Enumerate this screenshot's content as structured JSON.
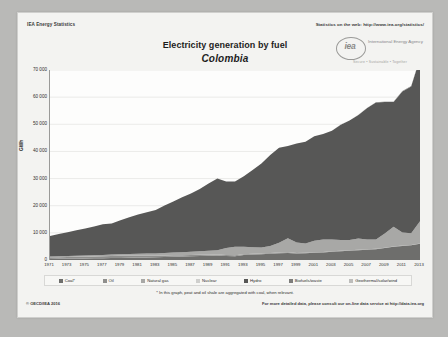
{
  "header": {
    "left": "IEA Energy Statistics",
    "right": "Statistics on the web: http://www.iea.org/statistics/"
  },
  "logo": {
    "word": "iea",
    "name": "International Energy Agency",
    "tagline": "Secure • Sustainable • Together"
  },
  "title": "Electricity generation by fuel",
  "subtitle": "Colombia",
  "footnote": "* In this graph, peat and oil shale are aggregated with coal, when relevant.",
  "copyright": "© OECD/IEA 2016",
  "more_info": "For more detailed data, please consult our on-line data service at http://data.iea.org",
  "colors": {
    "coal": "#6e6e6c",
    "oil": "#8f8f8d",
    "natural_gas": "#a8a8a6",
    "nuclear": "#cfcfcd",
    "hydro": "#575756",
    "biofuels_waste": "#7d7d7b",
    "geothermal_solar_wind": "#bdbdbb",
    "plot_background": "#fdfdfc",
    "axis": "#9a9a98",
    "gridline": "#e2e2e0",
    "paper": "#f3f3f1"
  },
  "chart_data": {
    "type": "area",
    "title": "Electricity generation by fuel",
    "subtitle": "Colombia",
    "xlabel": "",
    "ylabel": "GWh",
    "ylim": [
      0,
      70000
    ],
    "yticks": [
      0,
      10000,
      20000,
      30000,
      40000,
      50000,
      60000,
      70000
    ],
    "ytick_labels": [
      "0",
      "10 000",
      "20 000",
      "30 000",
      "40 000",
      "50 000",
      "60 000",
      "70 000"
    ],
    "grid": true,
    "stacked": true,
    "legend_position": "bottom",
    "xlim": [
      1971,
      2013
    ],
    "xtick_labels": [
      "1971",
      "1973",
      "1975",
      "1977",
      "1979",
      "1981",
      "1983",
      "1985",
      "1987",
      "1989",
      "1991",
      "1993",
      "1995",
      "1997",
      "1999",
      "2001",
      "2003",
      "2005",
      "2007",
      "2009",
      "2011",
      "2013"
    ],
    "x": [
      1971,
      1972,
      1973,
      1974,
      1975,
      1976,
      1977,
      1978,
      1979,
      1980,
      1981,
      1982,
      1983,
      1984,
      1985,
      1986,
      1987,
      1988,
      1989,
      1990,
      1991,
      1992,
      1993,
      1994,
      1995,
      1996,
      1997,
      1998,
      1999,
      2000,
      2001,
      2002,
      2003,
      2004,
      2005,
      2006,
      2007,
      2008,
      2009,
      2010,
      2011,
      2012,
      2013
    ],
    "series": [
      {
        "name": "Coal*",
        "color": "#6e6e6c",
        "values": [
          400,
          430,
          460,
          500,
          540,
          600,
          650,
          700,
          760,
          820,
          880,
          940,
          1000,
          1100,
          1200,
          1300,
          1400,
          1500,
          1600,
          1700,
          1500,
          1400,
          1800,
          2000,
          2100,
          2300,
          2500,
          2600,
          2400,
          2500,
          2700,
          2800,
          3000,
          3200,
          3400,
          3600,
          3800,
          4000,
          4400,
          4900,
          5200,
          5400,
          6000
        ]
      },
      {
        "name": "Oil",
        "color": "#8f8f8d",
        "values": [
          600,
          620,
          640,
          660,
          680,
          700,
          720,
          740,
          760,
          780,
          700,
          650,
          600,
          560,
          520,
          480,
          440,
          400,
          380,
          360,
          340,
          320,
          300,
          280,
          260,
          250,
          240,
          230,
          220,
          210,
          200,
          190,
          180,
          170,
          160,
          150,
          140,
          130,
          120,
          110,
          100,
          95,
          90
        ]
      },
      {
        "name": "Natural gas",
        "color": "#a8a8a6",
        "values": [
          300,
          320,
          350,
          380,
          420,
          460,
          500,
          550,
          600,
          650,
          700,
          760,
          820,
          900,
          1000,
          1100,
          1200,
          1300,
          1400,
          1500,
          2600,
          3200,
          2800,
          2400,
          2200,
          2600,
          3600,
          5200,
          3800,
          3400,
          4200,
          4600,
          4400,
          4000,
          3800,
          4200,
          3600,
          3400,
          5200,
          7200,
          4800,
          4400,
          8200
        ]
      },
      {
        "name": "Nuclear",
        "color": "#cfcfcd",
        "values": [
          0,
          0,
          0,
          0,
          0,
          0,
          0,
          0,
          0,
          0,
          0,
          0,
          0,
          0,
          0,
          0,
          0,
          0,
          0,
          0,
          0,
          0,
          0,
          0,
          0,
          0,
          0,
          0,
          0,
          0,
          0,
          0,
          0,
          0,
          0,
          0,
          0,
          0,
          0,
          0,
          0,
          0,
          0
        ]
      },
      {
        "name": "Hydro",
        "color": "#575756",
        "values": [
          7500,
          8200,
          8800,
          9400,
          10000,
          10600,
          11300,
          11500,
          12500,
          13500,
          14500,
          15200,
          16000,
          17500,
          18800,
          20200,
          21500,
          23000,
          24800,
          26500,
          24500,
          24000,
          26000,
          28500,
          31000,
          33500,
          35000,
          34000,
          36500,
          37500,
          38500,
          38800,
          40000,
          42500,
          44000,
          45500,
          48500,
          50500,
          48500,
          46000,
          52000,
          54000,
          60000
        ]
      },
      {
        "name": "Biofuels/waste",
        "color": "#7d7d7b",
        "values": [
          0,
          0,
          0,
          0,
          0,
          0,
          0,
          0,
          0,
          0,
          0,
          0,
          0,
          0,
          0,
          0,
          0,
          0,
          0,
          0,
          0,
          0,
          0,
          0,
          0,
          0,
          0,
          0,
          0,
          0,
          0,
          0,
          0,
          0,
          0,
          0,
          0,
          50,
          80,
          110,
          140,
          170,
          200
        ]
      },
      {
        "name": "Geothermal/solar/wind",
        "color": "#bdbdbb",
        "values": [
          0,
          0,
          0,
          0,
          0,
          0,
          0,
          0,
          0,
          0,
          0,
          0,
          0,
          0,
          0,
          0,
          0,
          0,
          0,
          0,
          0,
          0,
          0,
          0,
          0,
          0,
          0,
          0,
          0,
          0,
          0,
          0,
          0,
          50,
          50,
          50,
          50,
          50,
          50,
          50,
          50,
          50,
          50
        ]
      }
    ]
  },
  "legend": [
    {
      "label": "Coal*",
      "color": "#6e6e6c"
    },
    {
      "label": "Oil",
      "color": "#8f8f8d"
    },
    {
      "label": "Natural gas",
      "color": "#a8a8a6"
    },
    {
      "label": "Nuclear",
      "color": "#cfcfcd"
    },
    {
      "label": "Hydro",
      "color": "#575756"
    },
    {
      "label": "Biofuels/waste",
      "color": "#7d7d7b"
    },
    {
      "label": "Geothermal/solar/wind",
      "color": "#bdbdbb"
    }
  ]
}
